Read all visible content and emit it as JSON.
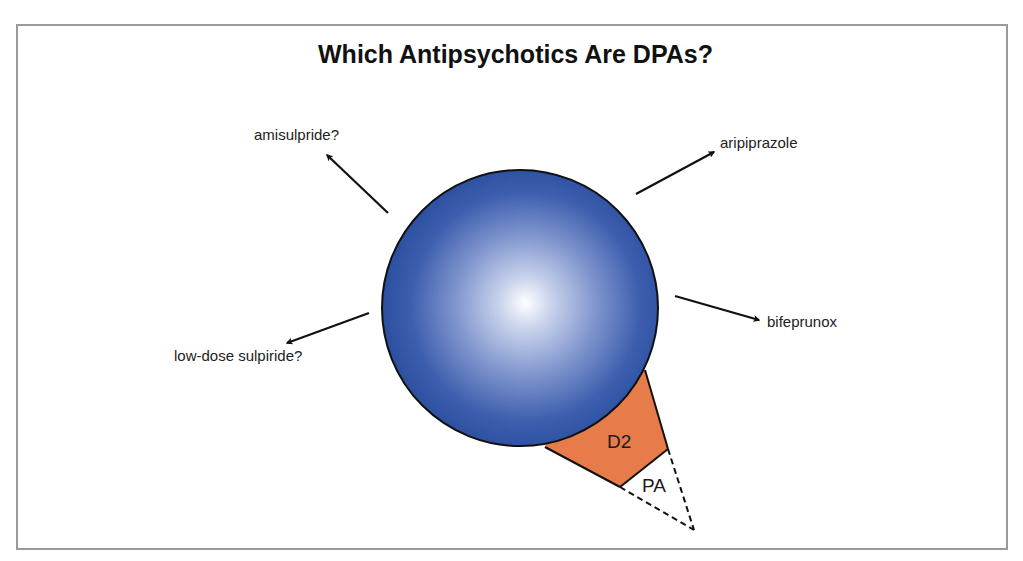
{
  "title": "Which Antipsychotics Are DPAs?",
  "drugs": [
    {
      "label": "amisulpride?",
      "direction": "upper-left"
    },
    {
      "label": "aripiprazole",
      "direction": "upper-right"
    },
    {
      "label": "bifeprunox",
      "direction": "right"
    },
    {
      "label": "low-dose sulpiride?",
      "direction": "lower-left"
    }
  ],
  "receptor": {
    "d2_label": "D2",
    "pa_label": "PA"
  },
  "colors": {
    "sphere_rim": "#2b4fa0",
    "sphere_highlight": "#ffffff",
    "d2_fill": "#e87b4a",
    "frame_border": "#9a9a9a",
    "arrow": "#111111"
  }
}
